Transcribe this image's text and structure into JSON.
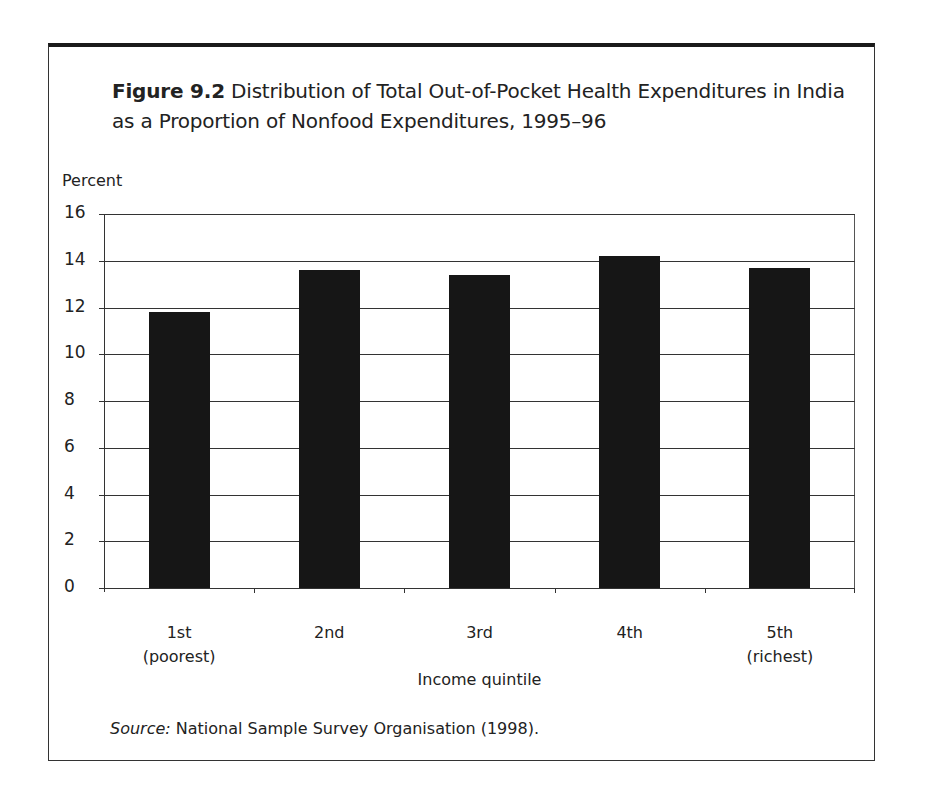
{
  "figure": {
    "number": "Figure 9.2",
    "title": "Distribution of Total Out-of-Pocket Health Expenditures in India as a Proportion of Nonfood Expenditures, 1995–96",
    "source_label": "Source:",
    "source_text": "National Sample Survey Organisation (1998)."
  },
  "chart_data": {
    "type": "bar",
    "title": "Figure 9.2 Distribution of Total Out-of-Pocket Health Expenditures in India as a Proportion of Nonfood Expenditures, 1995–96",
    "categories": [
      "1st (poorest)",
      "2nd",
      "3rd",
      "4th",
      "5th (richest)"
    ],
    "category_lines": [
      [
        "1st",
        "(poorest)"
      ],
      [
        "2nd",
        ""
      ],
      [
        "3rd",
        ""
      ],
      [
        "4th",
        ""
      ],
      [
        "5th",
        "(richest)"
      ]
    ],
    "values": [
      11.8,
      13.6,
      13.4,
      14.2,
      13.7
    ],
    "xlabel": "Income quintile",
    "ylabel": "Percent",
    "ylim": [
      0,
      16
    ],
    "yticks": [
      0,
      2,
      4,
      6,
      8,
      10,
      12,
      14,
      16
    ],
    "grid": true,
    "legend": null,
    "bar_color": "#161616",
    "source": "Source: National Sample Survey Organisation (1998)."
  }
}
